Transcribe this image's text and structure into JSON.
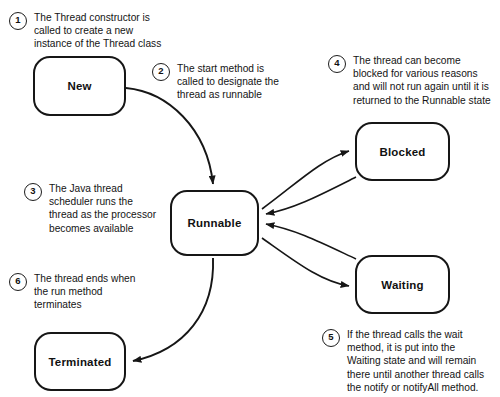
{
  "diagram": {
    "background_color": "#ffffff",
    "stroke_color": "#161616"
  },
  "states": {
    "new": {
      "label": "New"
    },
    "runnable": {
      "label": "Runnable"
    },
    "blocked": {
      "label": "Blocked"
    },
    "waiting": {
      "label": "Waiting"
    },
    "terminated": {
      "label": "Terminated"
    }
  },
  "notes": [
    {
      "number": "1",
      "text": "The Thread constructor is\ncalled to create a new\ninstance of the Thread class"
    },
    {
      "number": "2",
      "text": "The start method is\ncalled to designate the\nthread as runnable"
    },
    {
      "number": "3",
      "text": "The Java thread\nscheduler runs the\nthread as the processor\nbecomes available"
    },
    {
      "number": "4",
      "text": "The thread can become\nblocked for various reasons\nand will not run again until it is\nreturned to the Runnable state"
    },
    {
      "number": "5",
      "text": "If the thread calls the wait\nmethod, it is put into the\nWaiting state and will remain\nthere until another thread calls\nthe notify or notifyAll method."
    },
    {
      "number": "6",
      "text": "The thread ends when\nthe run method\nterminates"
    }
  ],
  "transitions": [
    {
      "from": "new",
      "to": "runnable",
      "note": "2"
    },
    {
      "from": "runnable",
      "to": "blocked",
      "note": "4"
    },
    {
      "from": "blocked",
      "to": "runnable",
      "note": "4"
    },
    {
      "from": "runnable",
      "to": "waiting",
      "note": "5"
    },
    {
      "from": "waiting",
      "to": "runnable",
      "note": "5"
    },
    {
      "from": "runnable",
      "to": "terminated",
      "note": "6"
    }
  ]
}
